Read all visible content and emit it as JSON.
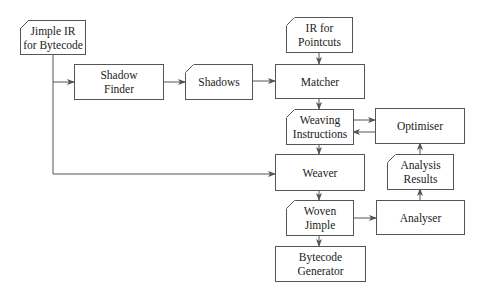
{
  "diagram": {
    "nodes": {
      "jimple_ir": {
        "label": "Jimple IR\nfor Bytecode",
        "shape": "document"
      },
      "shadow_finder": {
        "label": "Shadow\nFinder",
        "shape": "process"
      },
      "shadows": {
        "label": "Shadows",
        "shape": "document"
      },
      "ir_pointcuts": {
        "label": "IR for\nPointcuts",
        "shape": "document"
      },
      "matcher": {
        "label": "Matcher",
        "shape": "process"
      },
      "weaving_instructions": {
        "label": "Weaving\nInstructions",
        "shape": "document"
      },
      "optimiser": {
        "label": "Optimiser",
        "shape": "process"
      },
      "weaver": {
        "label": "Weaver",
        "shape": "process"
      },
      "analysis_results": {
        "label": "Analysis\nResults",
        "shape": "document"
      },
      "woven_jimple": {
        "label": "Woven\nJimple",
        "shape": "document"
      },
      "analyser": {
        "label": "Analyser",
        "shape": "process"
      },
      "bytecode_generator": {
        "label": "Bytecode\nGenerator",
        "shape": "process"
      }
    },
    "edges": [
      {
        "from": "Jimple IR for Bytecode",
        "to": "Shadow Finder"
      },
      {
        "from": "Jimple IR for Bytecode",
        "to": "Weaver"
      },
      {
        "from": "Shadow Finder",
        "to": "Shadows"
      },
      {
        "from": "Shadows",
        "to": "Matcher"
      },
      {
        "from": "IR for Pointcuts",
        "to": "Matcher"
      },
      {
        "from": "Matcher",
        "to": "Weaving Instructions"
      },
      {
        "from": "Weaving Instructions",
        "to": "Optimiser"
      },
      {
        "from": "Optimiser",
        "to": "Weaving Instructions"
      },
      {
        "from": "Weaving Instructions",
        "to": "Weaver"
      },
      {
        "from": "Weaver",
        "to": "Woven Jimple"
      },
      {
        "from": "Woven Jimple",
        "to": "Analyser"
      },
      {
        "from": "Analyser",
        "to": "Analysis Results"
      },
      {
        "from": "Analysis Results",
        "to": "Optimiser"
      },
      {
        "from": "Woven Jimple",
        "to": "Bytecode Generator"
      }
    ],
    "colors": {
      "stroke": "#555555",
      "text": "#222222",
      "background": "#ffffff"
    }
  }
}
